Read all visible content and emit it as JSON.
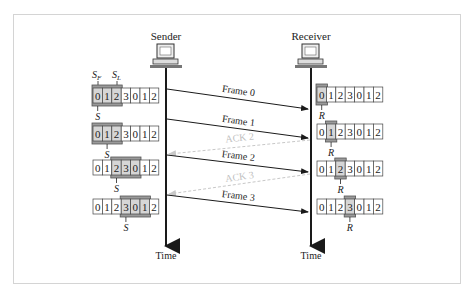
{
  "figure": {
    "sender": {
      "title": "Sender",
      "time_label": "Time"
    },
    "receiver": {
      "title": "Receiver",
      "time_label": "Time"
    },
    "sequence": [
      "0",
      "1",
      "2",
      "3",
      "0",
      "1",
      "2"
    ],
    "sender_labels": {
      "sf": "S",
      "sf_sub": "F",
      "sl": "S",
      "sl_sub": "L",
      "s": "S"
    },
    "receiver_label": "R",
    "messages": [
      {
        "label": "Frame 0",
        "type": "frame"
      },
      {
        "label": "Frame 1",
        "type": "frame"
      },
      {
        "label": "ACK 2",
        "type": "ack"
      },
      {
        "label": "Frame 2",
        "type": "frame"
      },
      {
        "label": "ACK 3",
        "type": "ack"
      },
      {
        "label": "Frame 3",
        "type": "frame"
      }
    ],
    "sender_windows": [
      {
        "start": 0,
        "end": 2,
        "s": 0
      },
      {
        "start": 0,
        "end": 2,
        "s": 1
      },
      {
        "start": 2,
        "end": 4,
        "s": 2
      },
      {
        "start": 3,
        "end": 5,
        "s": 3
      }
    ],
    "receiver_windows": [
      0,
      1,
      2,
      3
    ],
    "colors": {
      "line": "#1a1a1a",
      "ack": "#c8c8c8",
      "window_fill": "#9a9a9a",
      "cell_border": "#444444"
    }
  }
}
